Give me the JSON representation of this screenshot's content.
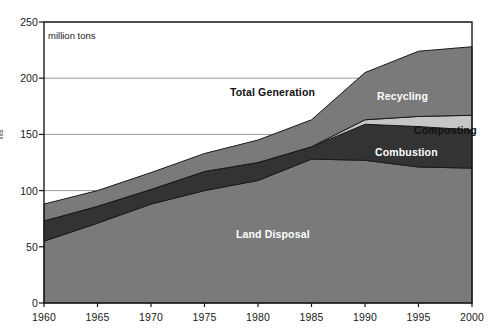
{
  "chart_data": {
    "type": "area",
    "title": "",
    "subtitle": "",
    "unit_note": "million tons",
    "xlabel": "",
    "ylabel": "",
    "stacked": true,
    "grid": true,
    "legend_position": "inline-labels",
    "x": [
      1960,
      1965,
      1970,
      1975,
      1980,
      1985,
      1990,
      1995,
      2000
    ],
    "xtick_labels": [
      "1960",
      "1965",
      "1970",
      "1975",
      "1980",
      "1985",
      "1990",
      "1995",
      "2000"
    ],
    "xlim": [
      1960,
      2000
    ],
    "ylim": [
      0,
      250
    ],
    "ytick_labels": [
      "0",
      "50",
      "100",
      "150",
      "200",
      "250"
    ],
    "yticks": [
      0,
      50,
      100,
      150,
      200,
      250
    ],
    "series": [
      {
        "name": "Land Disposal",
        "color": "#7a7a7a",
        "values": [
          55,
          71,
          88,
          100,
          109,
          128,
          127,
          121,
          120
        ]
      },
      {
        "name": "Combustion",
        "color": "#333333",
        "values": [
          18,
          15,
          13,
          17,
          16,
          11,
          32,
          36,
          34
        ]
      },
      {
        "name": "Composting",
        "color": "#c6c6c6",
        "values": [
          0,
          0,
          0,
          0,
          0,
          0,
          4,
          9,
          13
        ]
      },
      {
        "name": "Recycling",
        "color": "#7a7a7a",
        "values": [
          15,
          14,
          15,
          16,
          20,
          24,
          42,
          58,
          61
        ]
      }
    ],
    "totals": {
      "name": "Total Generation",
      "values": [
        88,
        100,
        116,
        133,
        145,
        163,
        205,
        224,
        228
      ]
    },
    "band_labels": [
      {
        "text": "Total Generation",
        "tone": "dark",
        "x": 230,
        "y": 86
      },
      {
        "text": "Recycling",
        "tone": "light",
        "x": 377,
        "y": 90
      },
      {
        "text": "Composting",
        "tone": "dark",
        "x": 414,
        "y": 124
      },
      {
        "text": "Combustion",
        "tone": "light",
        "x": 375,
        "y": 146
      },
      {
        "text": "Land Disposal",
        "tone": "light",
        "x": 236,
        "y": 228
      }
    ]
  },
  "axis": {
    "clipped_title": "ns"
  },
  "colors": {
    "plot_border": "#1a1a1a",
    "gridline": "#808080",
    "band_outline": "#1a1a1a",
    "background": "#ffffff"
  }
}
